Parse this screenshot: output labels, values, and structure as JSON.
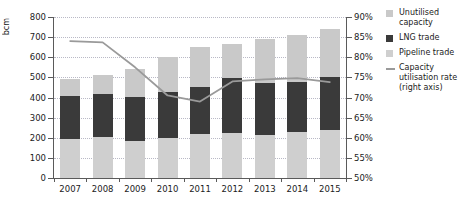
{
  "chart_data": {
    "type": "bar",
    "title": "",
    "subtitle": "",
    "xlabel": "",
    "ylabel": "bcm",
    "y2label": "",
    "ylim": [
      0,
      800
    ],
    "ylim_right": [
      50,
      90
    ],
    "ytick_step": 100,
    "ytick_step_right": 5,
    "grid": true,
    "stacked": true,
    "legend_position": "right",
    "categories": [
      "2007",
      "2008",
      "2009",
      "2010",
      "2011",
      "2012",
      "2013",
      "2014",
      "2015"
    ],
    "ytick_labels": [
      "800",
      "700",
      "600",
      "500",
      "400",
      "300",
      "200",
      "100",
      "0"
    ],
    "ytick_values": [
      800,
      700,
      600,
      500,
      400,
      300,
      200,
      100,
      0
    ],
    "ytick_labels_right": [
      "90%",
      "85%",
      "80%",
      "75%",
      "70%",
      "65%",
      "60%",
      "55%",
      "50%"
    ],
    "ytick_values_right": [
      90,
      85,
      80,
      75,
      70,
      65,
      60,
      55,
      50
    ],
    "series": [
      {
        "name": "Pipeline trade",
        "color": "#cfcfcf",
        "values": [
          195,
          205,
          185,
          198,
          220,
          222,
          212,
          228,
          238
        ]
      },
      {
        "name": "LNG trade",
        "color": "#3a3a3a",
        "values": [
          215,
          215,
          220,
          228,
          230,
          275,
          262,
          250,
          262
        ]
      },
      {
        "name": "Unutilised capacity",
        "color": "#c9c9c9",
        "values": [
          80,
          90,
          135,
          175,
          200,
          168,
          216,
          232,
          240
        ]
      }
    ],
    "totals": [
      490,
      510,
      540,
      601,
      650,
      665,
      690,
      710,
      740
    ],
    "line_series": {
      "name": "Capacity utilisation rate (right axis)",
      "color": "#9a9a9a",
      "axis": "right",
      "unit": "%",
      "values": [
        84.0,
        83.7,
        77.5,
        70.5,
        69.0,
        74.0,
        74.5,
        74.8,
        73.8
      ]
    }
  },
  "legend": {
    "items": [
      {
        "name": "unutilised-capacity",
        "label": "Unutilised capacity",
        "marker": "square",
        "color": "#c9c9c9"
      },
      {
        "name": "lng-trade",
        "label": "LNG trade",
        "marker": "square",
        "color": "#3a3a3a"
      },
      {
        "name": "pipeline-trade",
        "label": "Pipeline trade",
        "marker": "square",
        "color": "#cfcfcf"
      },
      {
        "name": "capacity-utilisation-rate",
        "label": "Capacity utilisation rate (right axis)",
        "marker": "line",
        "color": "#9a9a9a"
      }
    ]
  }
}
